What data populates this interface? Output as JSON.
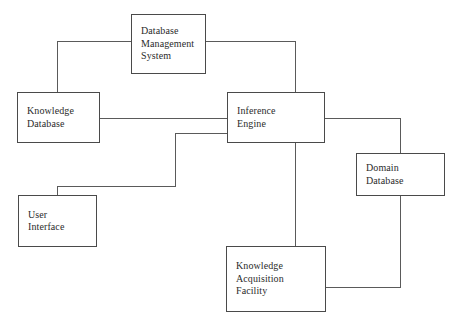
{
  "diagram": {
    "background_color": "#ffffff",
    "line_color": "#5a5a5a",
    "box_border_color": "#4a4a4a",
    "text_color": "#2b2b2b",
    "nodes": [
      {
        "id": "database-management-system",
        "label": "Database\nManagement\nSystem",
        "x": 131,
        "y": 14,
        "w": 75,
        "h": 60
      },
      {
        "id": "knowledge-database",
        "label": "Knowledge\nDatabase",
        "x": 17,
        "y": 92,
        "w": 83,
        "h": 51
      },
      {
        "id": "inference-engine",
        "label": "Inference\nEngine",
        "x": 227,
        "y": 92,
        "w": 98,
        "h": 51
      },
      {
        "id": "domain-database",
        "label": "Domain\nDatabase",
        "x": 356,
        "y": 153,
        "w": 89,
        "h": 43
      },
      {
        "id": "user-interface",
        "label": "User\nInterface",
        "x": 18,
        "y": 195,
        "w": 79,
        "h": 52
      },
      {
        "id": "knowledge-acquisition-facility",
        "label": "Knowledge\nAcquisition\nFacility",
        "x": 226,
        "y": 246,
        "w": 100,
        "h": 66
      }
    ],
    "connectors": [
      {
        "id": "dms-to-knowledge-database",
        "from": "database-management-system",
        "to": "knowledge-database",
        "segments": [
          {
            "orient": "h",
            "x": 57,
            "y": 41,
            "len": 74
          },
          {
            "orient": "v",
            "x": 57,
            "y": 41,
            "len": 52
          }
        ]
      },
      {
        "id": "dms-to-inference-engine",
        "from": "database-management-system",
        "to": "inference-engine",
        "segments": [
          {
            "orient": "h",
            "x": 206,
            "y": 41,
            "len": 90
          },
          {
            "orient": "v",
            "x": 295,
            "y": 41,
            "len": 52
          }
        ]
      },
      {
        "id": "knowledge-database-to-inference-engine",
        "from": "knowledge-database",
        "to": "inference-engine",
        "segments": [
          {
            "orient": "h",
            "x": 100,
            "y": 118,
            "len": 128
          }
        ]
      },
      {
        "id": "inference-engine-to-user-interface",
        "from": "inference-engine",
        "to": "user-interface",
        "segments": [
          {
            "orient": "h",
            "x": 175,
            "y": 133,
            "len": 53
          },
          {
            "orient": "v",
            "x": 175,
            "y": 133,
            "len": 54
          },
          {
            "orient": "h",
            "x": 57,
            "y": 186,
            "len": 119
          },
          {
            "orient": "v",
            "x": 57,
            "y": 186,
            "len": 10
          }
        ]
      },
      {
        "id": "inference-engine-to-domain-database",
        "from": "inference-engine",
        "to": "domain-database",
        "segments": [
          {
            "orient": "h",
            "x": 325,
            "y": 118,
            "len": 76
          },
          {
            "orient": "v",
            "x": 400,
            "y": 118,
            "len": 36
          }
        ]
      },
      {
        "id": "inference-engine-to-knowledge-acquisition-facility",
        "from": "inference-engine",
        "to": "knowledge-acquisition-facility",
        "segments": [
          {
            "orient": "v",
            "x": 295,
            "y": 143,
            "len": 104
          }
        ]
      },
      {
        "id": "domain-database-to-knowledge-acquisition-facility",
        "from": "domain-database",
        "to": "knowledge-acquisition-facility",
        "segments": [
          {
            "orient": "v",
            "x": 400,
            "y": 196,
            "len": 92
          },
          {
            "orient": "h",
            "x": 326,
            "y": 287,
            "len": 75
          }
        ]
      }
    ]
  }
}
